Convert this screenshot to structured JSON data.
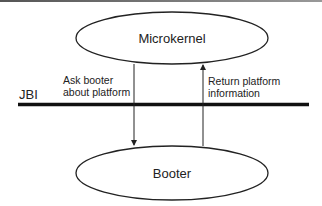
{
  "diagram": {
    "nodes": [
      {
        "id": "microkernel",
        "label": "Microkernel"
      },
      {
        "id": "booter",
        "label": "Booter"
      }
    ],
    "boundary": {
      "label": "JBI"
    },
    "edges": [
      {
        "from": "microkernel",
        "to": "booter",
        "label_line1": "Ask booter",
        "label_line2": "about platform"
      },
      {
        "from": "booter",
        "to": "microkernel",
        "label_line1": "Return platform",
        "label_line2": "information"
      }
    ],
    "colors": {
      "stroke": "#222222",
      "background": "#ffffff"
    }
  }
}
